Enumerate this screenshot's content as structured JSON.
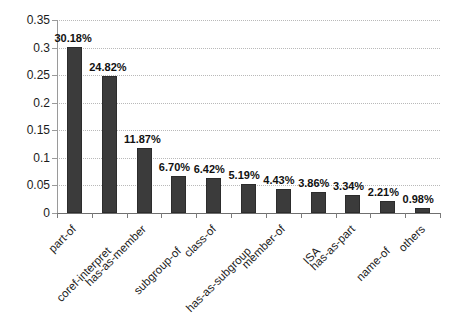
{
  "chart_data": {
    "type": "bar",
    "title": "",
    "subtitle": "",
    "xlabel": "",
    "ylabel": "",
    "grid": true,
    "legend": false,
    "ylim": [
      0,
      0.35
    ],
    "ytick_labels": [
      "0",
      "0.05",
      "0.1",
      "0.15",
      "0.2",
      "0.25",
      "0.3",
      "0.35"
    ],
    "ytick_values": [
      0,
      0.05,
      0.1,
      0.15,
      0.2,
      0.25,
      0.3,
      0.35
    ],
    "categories": [
      "part-of",
      "coref-interpret",
      "has-as-member",
      "subgroup-of",
      "class-of",
      "has-as-subgroup",
      "member-of",
      "ISA",
      "has-as-part",
      "name-of",
      "others"
    ],
    "values": [
      0.3018,
      0.2482,
      0.1187,
      0.067,
      0.0642,
      0.0519,
      0.0443,
      0.0386,
      0.0334,
      0.0221,
      0.0098
    ],
    "data_labels": [
      "30.18%",
      "24.82%",
      "11.87%",
      "6.70%",
      "6.42%",
      "5.19%",
      "4.43%",
      "3.86%",
      "3.34%",
      "2.21%",
      "0.98%"
    ],
    "bar_color": "#3b3b3b",
    "grid_color": "#b9b9b9",
    "axis_color": "#6f6f6f"
  }
}
